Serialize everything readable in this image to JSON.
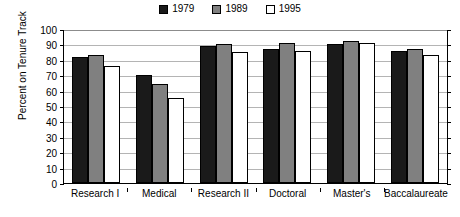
{
  "chart_data": {
    "type": "bar",
    "title": "",
    "xlabel": "",
    "ylabel": "Percent on Tenure Track",
    "ylim": [
      0,
      100
    ],
    "yticks": [
      0,
      10,
      20,
      30,
      40,
      50,
      60,
      70,
      80,
      90,
      100
    ],
    "grid": true,
    "legend_position": "top-center",
    "categories": [
      "Research I",
      "Medical",
      "Research II",
      "Doctoral",
      "Master's",
      "Baccalaureate"
    ],
    "series": [
      {
        "name": "1979",
        "color": "#1a1a1a",
        "values": [
          82,
          70,
          89,
          87,
          90,
          86
        ]
      },
      {
        "name": "1989",
        "color": "#808080",
        "values": [
          83,
          64,
          90,
          91,
          92,
          87
        ]
      },
      {
        "name": "1995",
        "color": "#ffffff",
        "values": [
          76,
          55,
          85,
          86,
          91,
          83
        ]
      }
    ]
  },
  "legend": {
    "items": [
      {
        "label": "1979",
        "swatch": "black-square-icon"
      },
      {
        "label": "1989",
        "swatch": "gray-square-icon"
      },
      {
        "label": "1995",
        "swatch": "white-square-icon"
      }
    ]
  },
  "axes": {
    "y_title": "Percent on Tenure Track",
    "y_labels": [
      "100",
      "90",
      "80",
      "70",
      "60",
      "50",
      "40",
      "30",
      "20",
      "10",
      "0"
    ]
  }
}
